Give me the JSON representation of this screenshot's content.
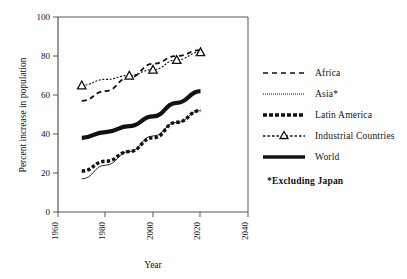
{
  "chart_data": {
    "type": "line",
    "title": "",
    "xlabel": "Year",
    "ylabel": "Percent increase in population",
    "xlim": [
      1960,
      2040
    ],
    "ylim": [
      0,
      100
    ],
    "xticks": [
      1960,
      1980,
      2000,
      2020,
      2040
    ],
    "yticks": [
      0,
      20,
      40,
      60,
      80,
      100
    ],
    "grid": false,
    "legend_position": "right",
    "x": [
      1970,
      1980,
      1990,
      2000,
      2010,
      2020
    ],
    "series": [
      {
        "name": "Africa",
        "style": "dashed",
        "values": [
          57,
          62,
          69,
          76,
          80,
          83
        ]
      },
      {
        "name": "Asia*",
        "style": "fine-dotted",
        "values": [
          17,
          24,
          31,
          39,
          46,
          52
        ]
      },
      {
        "name": "Latin America",
        "style": "thick-dashed",
        "values": [
          21,
          26,
          31,
          38,
          46,
          52
        ]
      },
      {
        "name": "Industrial Countries",
        "style": "dotted-with-triangles",
        "values": [
          65,
          68,
          70,
          73,
          78,
          82
        ],
        "marker": "triangle",
        "marker_x": [
          1970,
          1990,
          2000,
          2010,
          2020
        ],
        "marker_values": [
          65,
          70,
          73,
          78,
          82
        ]
      },
      {
        "name": "World",
        "style": "thick-solid",
        "values": [
          38,
          41,
          44,
          49,
          56,
          62
        ]
      }
    ]
  },
  "axes": {
    "y_title": "Percent increase in population",
    "x_title": "Year",
    "y_tick_labels": [
      "0",
      "20",
      "40",
      "60",
      "80",
      "100"
    ],
    "x_tick_labels": [
      "1960",
      "1980",
      "2000",
      "2020",
      "2040"
    ]
  },
  "legend": {
    "items": [
      {
        "label": "Africa",
        "sample": "dashed-line-sample"
      },
      {
        "label": "Asia*",
        "sample": "fine-dotted-line-sample"
      },
      {
        "label": "Latin America",
        "sample": "thick-dashed-line-sample"
      },
      {
        "label": "Industrial Countries",
        "sample": "triangle-marker-line-sample"
      },
      {
        "label": "World",
        "sample": "thick-solid-line-sample"
      }
    ],
    "footnote": "*Excluding Japan"
  },
  "colors": {
    "ink": "#111111",
    "axis": "#555555",
    "background": "#ffffff"
  }
}
